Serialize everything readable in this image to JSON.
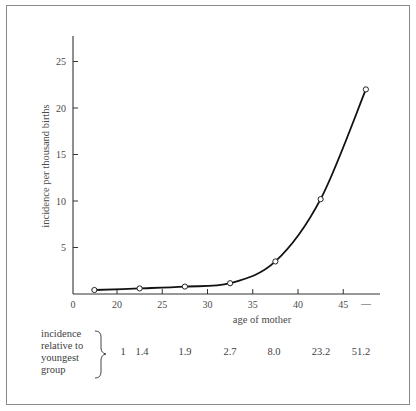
{
  "chart_data": {
    "type": "line",
    "title": "",
    "xlabel": "age of mother",
    "ylabel": "incidence per thousand births",
    "x_tick_labels": [
      "0",
      "20",
      "25",
      "30",
      "35",
      "40",
      "45",
      "—"
    ],
    "x_tick_values": [
      20,
      25,
      30,
      35,
      40,
      45
    ],
    "y_tick_labels": [
      "5",
      "10",
      "15",
      "20",
      "25"
    ],
    "y_tick_values": [
      5,
      10,
      15,
      20,
      25
    ],
    "ylim": [
      0,
      27.5
    ],
    "xlim_note": "axis break after 0, starts near 14",
    "grid": false,
    "legend": null,
    "series": [
      {
        "name": "incidence per thousand births",
        "marker": "open-circle",
        "x": [
          17.5,
          22.5,
          27.5,
          32.5,
          37.5,
          42.5,
          47.5
        ],
        "values": [
          0.43,
          0.6,
          0.8,
          1.16,
          3.5,
          10.2,
          22.0
        ]
      }
    ],
    "relative_row": {
      "label_lines": [
        "incidence",
        "relative to",
        "youngest",
        "group"
      ],
      "values": [
        "1",
        "1.4",
        "1.9",
        "2.7",
        "8.0",
        "23.2",
        "51.2"
      ]
    }
  }
}
